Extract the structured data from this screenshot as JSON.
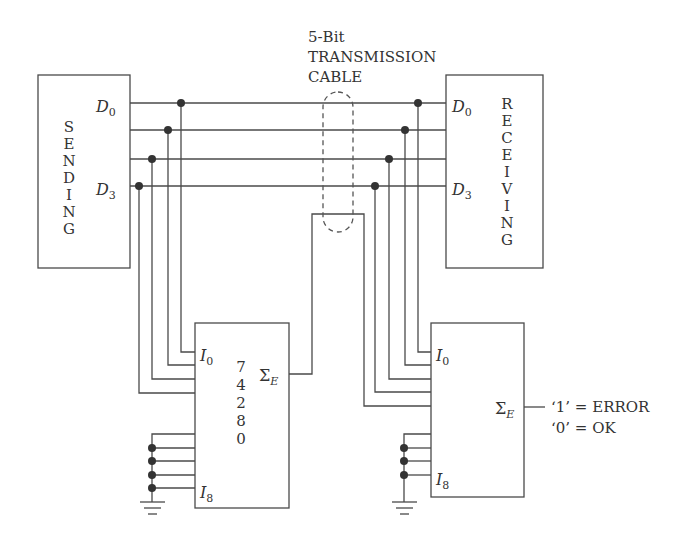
{
  "cable": {
    "line1": "5-Bit",
    "line2": "TRANSMISSION",
    "line3": "CABLE"
  },
  "sending": {
    "letters": [
      "S",
      "E",
      "N",
      "D",
      "I",
      "N",
      "G"
    ],
    "pin_top": "D",
    "pin_top_sub": "0",
    "pin_bottom": "D",
    "pin_bottom_sub": "3"
  },
  "receiving": {
    "letters": [
      "R",
      "E",
      "C",
      "E",
      "I",
      "V",
      "I",
      "N",
      "G"
    ],
    "pin_top": "D",
    "pin_top_sub": "0",
    "pin_bottom": "D",
    "pin_bottom_sub": "3"
  },
  "generator_ic": {
    "part_digits": [
      "7",
      "4",
      "2",
      "8",
      "0"
    ],
    "input_top": "I",
    "input_top_sub": "0",
    "input_bottom": "I",
    "input_bottom_sub": "8",
    "output": "Σ",
    "output_sub": "E"
  },
  "checker_ic": {
    "input_top": "I",
    "input_top_sub": "0",
    "input_bottom": "I",
    "input_bottom_sub": "8",
    "output": "Σ",
    "output_sub": "E"
  },
  "output_legend": {
    "error": "‘1’ = ERROR",
    "ok": "‘0’ = OK"
  }
}
